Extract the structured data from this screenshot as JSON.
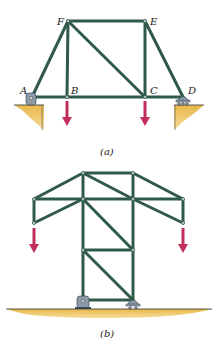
{
  "figure_a": {
    "caption": "(a)",
    "labels": {
      "A": "A",
      "B": "B",
      "C": "C",
      "D": "D",
      "E": "E",
      "F": "F"
    }
  },
  "figure_b": {
    "caption": "(b)"
  },
  "colors": {
    "member": "#2f5a4a",
    "load_arrow": "#c0305a",
    "ground": "#e8b84a",
    "support": "#8c9aa8"
  }
}
